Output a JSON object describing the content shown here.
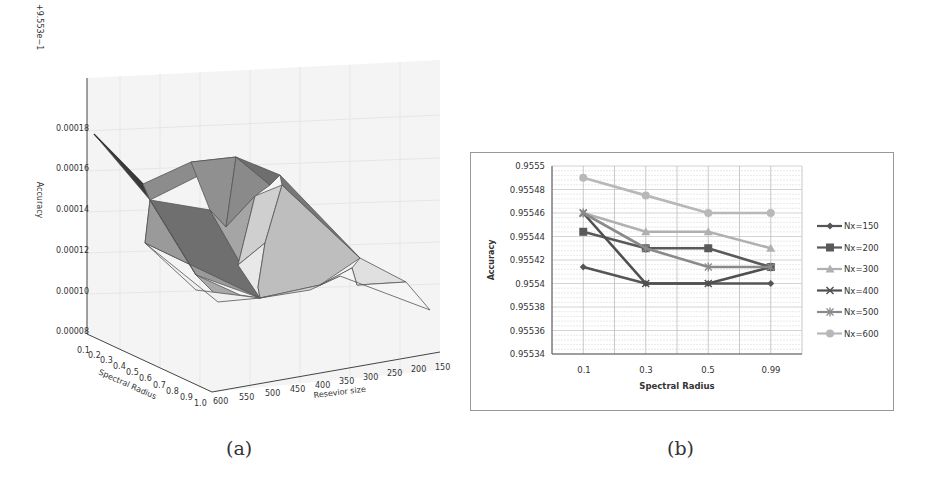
{
  "chart_data": [
    {
      "id": "a",
      "type": "surface3d",
      "caption": "(a)",
      "offset_label": "+9.553e−1",
      "zlabel": "Accuracy",
      "xlabel": "Spectral Radius",
      "ylabel": "Resevior size",
      "z_ticks": [
        "0.00018",
        "0.00016",
        "0.00014",
        "0.00012",
        "0.00010",
        "0.00008"
      ],
      "x_ticks": [
        "0.1",
        "0.2",
        "0.3",
        "0.4",
        "0.5",
        "0.6",
        "0.7",
        "0.8",
        "0.9",
        "1.0"
      ],
      "y_ticks": [
        "600",
        "550",
        "500",
        "450",
        "400",
        "350",
        "300",
        "250",
        "200",
        "150"
      ],
      "grid": true
    },
    {
      "id": "b",
      "type": "line",
      "caption": "(b)",
      "title": "",
      "xlabel": "Spectral Radius",
      "ylabel": "Accuracy",
      "categories": [
        "0.1",
        "0.3",
        "0.5",
        "0.99"
      ],
      "y_ticks": [
        "0.9555",
        "0.95548",
        "0.95546",
        "0.95544",
        "0.95542",
        "0.9554",
        "0.95538",
        "0.95536",
        "0.95534"
      ],
      "ylim": [
        0.95534,
        0.9555
      ],
      "grid": true,
      "legend_position": "right",
      "series": [
        {
          "name": "Nx=150",
          "marker": "diamond",
          "color": "#555555",
          "values": [
            0.955414,
            0.9554,
            0.9554,
            0.9554
          ]
        },
        {
          "name": "Nx=200",
          "marker": "square",
          "color": "#595959",
          "values": [
            0.955444,
            0.95543,
            0.95543,
            0.955414
          ]
        },
        {
          "name": "Nx=300",
          "marker": "triangle",
          "color": "#b0b0b0",
          "values": [
            0.95546,
            0.955444,
            0.955444,
            0.95543
          ]
        },
        {
          "name": "Nx=400",
          "marker": "x",
          "color": "#505050",
          "values": [
            0.95546,
            0.9554,
            0.9554,
            0.955414
          ]
        },
        {
          "name": "Nx=500",
          "marker": "star",
          "color": "#8a8a8a",
          "values": [
            0.95546,
            0.95543,
            0.955414,
            0.955414
          ]
        },
        {
          "name": "Nx=600",
          "marker": "circle",
          "color": "#b8b8b8",
          "values": [
            0.95549,
            0.955475,
            0.95546,
            0.95546
          ]
        }
      ]
    }
  ]
}
